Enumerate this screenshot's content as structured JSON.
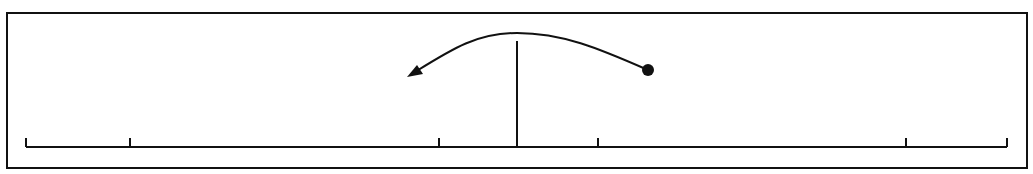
{
  "diagram": {
    "type": "number-line-with-jump-arrow",
    "stroke_color": "#111111",
    "background": "#ffffff",
    "frame": {
      "x": 7,
      "y": 13,
      "width": 1020,
      "height": 155
    },
    "axis": {
      "y": 147,
      "x_start": 26,
      "x_end": 1007
    },
    "ticks": [
      {
        "x": 26,
        "height": 9
      },
      {
        "x": 130,
        "height": 9
      },
      {
        "x": 439,
        "height": 9
      },
      {
        "x": 598,
        "height": 9
      },
      {
        "x": 906,
        "height": 9
      },
      {
        "x": 1007,
        "height": 9
      }
    ],
    "center_line": {
      "x": 517,
      "y_top": 41,
      "y_bottom": 147
    },
    "arc": {
      "start": {
        "x": 648,
        "y": 70
      },
      "peak": {
        "x": 517,
        "y": 33
      },
      "end": {
        "x": 407,
        "y": 77
      },
      "start_marker": "dot",
      "end_marker": "arrowhead"
    }
  }
}
